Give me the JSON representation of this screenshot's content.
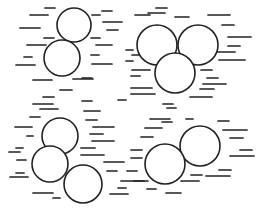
{
  "figure": {
    "width": 263,
    "height": 208,
    "background": "#ffffff",
    "stroke_color": "#222222",
    "circle_stroke_width": 1.6,
    "dash_stroke_width": 1.7
  },
  "groups": [
    {
      "name": "group-top-left",
      "circles": [
        {
          "cx": 74,
          "cy": 25,
          "r": 17
        },
        {
          "cx": 62,
          "cy": 58,
          "r": 18
        }
      ]
    },
    {
      "name": "group-top-right",
      "circles": [
        {
          "cx": 157,
          "cy": 45,
          "r": 20
        },
        {
          "cx": 198,
          "cy": 45,
          "r": 20
        },
        {
          "cx": 175,
          "cy": 73,
          "r": 20
        }
      ]
    },
    {
      "name": "group-bottom-left",
      "circles": [
        {
          "cx": 60,
          "cy": 136,
          "r": 18
        },
        {
          "cx": 50,
          "cy": 164,
          "r": 18
        },
        {
          "cx": 83,
          "cy": 184,
          "r": 19
        }
      ]
    },
    {
      "name": "group-bottom-right",
      "circles": [
        {
          "cx": 200,
          "cy": 146,
          "r": 20
        },
        {
          "cx": 165,
          "cy": 164,
          "r": 20
        }
      ]
    }
  ],
  "dashes": [
    [
      45,
      8,
      55
    ],
    [
      30,
      15,
      48
    ],
    [
      20,
      28,
      40
    ],
    [
      44,
      38,
      54
    ],
    [
      27,
      45,
      46
    ],
    [
      24,
      57,
      32
    ],
    [
      16,
      65,
      35
    ],
    [
      33,
      80,
      52
    ],
    [
      60,
      90,
      72
    ],
    [
      43,
      97,
      54
    ],
    [
      82,
      101,
      92
    ],
    [
      92,
      15,
      100
    ],
    [
      102,
      11,
      112
    ],
    [
      103,
      22,
      122
    ],
    [
      107,
      30,
      118
    ],
    [
      91,
      38,
      100
    ],
    [
      96,
      45,
      112
    ],
    [
      91,
      55,
      99
    ],
    [
      92,
      64,
      112
    ],
    [
      73,
      79,
      93
    ],
    [
      82,
      78,
      92
    ],
    [
      126,
      50,
      133
    ],
    [
      126,
      61,
      133
    ],
    [
      135,
      15,
      150
    ],
    [
      156,
      8,
      167
    ],
    [
      175,
      17,
      189
    ],
    [
      148,
      13,
      165
    ],
    [
      208,
      15,
      230
    ],
    [
      222,
      25,
      234
    ],
    [
      228,
      37,
      251
    ],
    [
      228,
      46,
      240
    ],
    [
      219,
      60,
      245
    ],
    [
      216,
      52,
      235
    ],
    [
      201,
      70,
      212
    ],
    [
      207,
      78,
      218
    ],
    [
      203,
      84,
      226
    ],
    [
      200,
      89,
      214
    ],
    [
      190,
      97,
      212
    ],
    [
      132,
      55,
      140
    ],
    [
      132,
      70,
      150
    ],
    [
      131,
      76,
      140
    ],
    [
      131,
      88,
      152
    ],
    [
      131,
      94,
      155
    ],
    [
      163,
      104,
      173
    ],
    [
      33,
      104,
      53
    ],
    [
      40,
      109,
      58
    ],
    [
      30,
      117,
      40
    ],
    [
      15,
      127,
      32
    ],
    [
      27,
      136,
      33
    ],
    [
      16,
      148,
      23
    ],
    [
      9,
      152,
      20
    ],
    [
      17,
      160,
      26
    ],
    [
      16,
      173,
      24
    ],
    [
      10,
      177,
      28
    ],
    [
      33,
      193,
      53
    ],
    [
      53,
      198,
      60
    ],
    [
      84,
      111,
      100
    ],
    [
      86,
      120,
      97
    ],
    [
      93,
      127,
      114
    ],
    [
      90,
      134,
      103
    ],
    [
      92,
      141,
      114
    ],
    [
      81,
      148,
      95
    ],
    [
      81,
      155,
      104
    ],
    [
      104,
      162,
      124
    ],
    [
      107,
      171,
      117
    ],
    [
      127,
      171,
      137
    ],
    [
      121,
      181,
      148
    ],
    [
      118,
      188,
      126
    ],
    [
      110,
      194,
      128
    ],
    [
      118,
      100,
      126
    ],
    [
      167,
      108,
      176
    ],
    [
      150,
      119,
      170
    ],
    [
      162,
      122,
      172
    ],
    [
      145,
      128,
      162
    ],
    [
      141,
      137,
      153
    ],
    [
      131,
      150,
      142
    ],
    [
      131,
      158,
      142
    ],
    [
      186,
      119,
      193
    ],
    [
      218,
      121,
      229
    ],
    [
      223,
      130,
      247
    ],
    [
      230,
      138,
      243
    ],
    [
      240,
      150,
      252
    ],
    [
      230,
      156,
      254
    ],
    [
      219,
      170,
      231
    ],
    [
      206,
      176,
      230
    ],
    [
      191,
      175,
      202
    ],
    [
      181,
      181,
      199
    ],
    [
      166,
      193,
      181
    ],
    [
      147,
      189,
      156
    ],
    [
      134,
      181,
      144
    ]
  ]
}
